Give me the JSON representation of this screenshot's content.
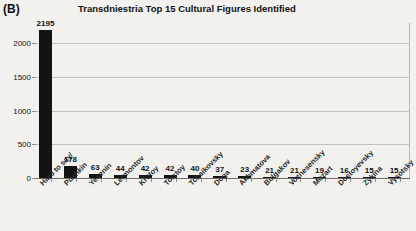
{
  "panel": {
    "label": "(B)"
  },
  "chart_data": {
    "type": "bar",
    "title": "Transdniestria Top 15 Cultural Figures Identified",
    "xlabel": "",
    "ylabel": "",
    "ylim": [
      0,
      2300
    ],
    "grid": true,
    "legend": null,
    "yticks": [
      0,
      500,
      1000,
      1500,
      2000
    ],
    "ytick_labels": [
      "0",
      "500",
      "1000",
      "1500",
      "2000"
    ],
    "categories": [
      "Hard to say/",
      "Pushkin",
      "Yesenin",
      "Lermontov",
      "Krutoy",
      "Tolstoy",
      "Tchaikovsky",
      "Doga",
      "Akhmatova",
      "Bulgakov",
      "Voznesensky",
      "Mozart",
      "Dostoyevsky",
      "Zykina",
      "Vysotsky"
    ],
    "values": [
      2195,
      178,
      63,
      44,
      42,
      42,
      40,
      37,
      23,
      21,
      21,
      19,
      16,
      15,
      15
    ],
    "data_labels": [
      "2195",
      "178",
      "63",
      "44",
      "42",
      "42",
      "40",
      "37",
      "23",
      "21",
      "21",
      "19",
      "16",
      "15",
      "15"
    ],
    "bar_color": "#131313",
    "background_color": "#f2f1ee"
  }
}
